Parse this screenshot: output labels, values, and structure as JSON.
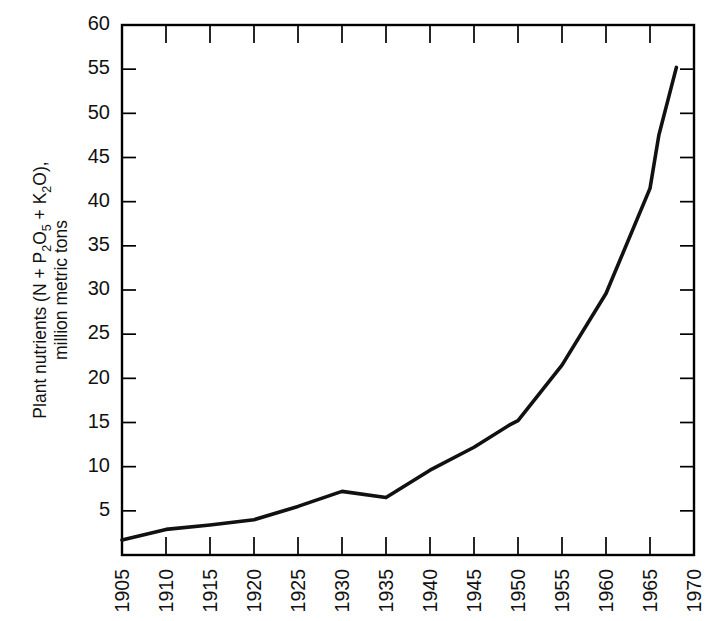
{
  "chart_data": {
    "type": "line",
    "title": "",
    "xlabel": "",
    "ylabel": "Plant nutrients (N + P2O5 + K2O), million metric tons",
    "ylabel_lines": [
      "Plant nutrients (N + P2O5 + K2O),",
      "million metric tons"
    ],
    "ylabel_parts": {
      "seg1": "Plant nutrients (N + P",
      "sub1": "2",
      "seg2": "O",
      "sub2": "5",
      "seg3": " + K",
      "sub3": "2",
      "seg4": "O),",
      "line2": "million metric tons"
    },
    "xlim": [
      1905,
      1970
    ],
    "ylim": [
      0,
      60
    ],
    "grid": false,
    "legend": "none",
    "y_ticks": [
      5,
      10,
      15,
      20,
      25,
      30,
      35,
      40,
      45,
      50,
      55,
      60
    ],
    "y_tick_labels": [
      "5",
      "10",
      "15",
      "20",
      "25",
      "30",
      "35",
      "40",
      "45",
      "50",
      "55",
      "60"
    ],
    "x_ticks": [
      1905,
      1910,
      1915,
      1920,
      1925,
      1930,
      1935,
      1940,
      1945,
      1950,
      1955,
      1960,
      1965,
      1970
    ],
    "x_tick_labels": [
      "1905",
      "1910",
      "1915",
      "1920",
      "1925",
      "1930",
      "1935",
      "1940",
      "1945",
      "1950",
      "1955",
      "1960",
      "1965",
      "1970"
    ],
    "series": [
      {
        "name": "World plant nutrient consumption",
        "color": "#111111",
        "x": [
          1905,
          1910,
          1915,
          1920,
          1925,
          1930,
          1935,
          1940,
          1945,
          1949,
          1950,
          1955,
          1960,
          1965,
          1966,
          1968
        ],
        "values": [
          1.7,
          2.9,
          3.4,
          4.0,
          5.5,
          7.2,
          6.5,
          9.6,
          12.2,
          14.7,
          15.2,
          21.5,
          29.6,
          41.5,
          47.5,
          55.2
        ]
      }
    ],
    "annotations": []
  }
}
